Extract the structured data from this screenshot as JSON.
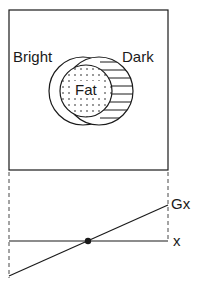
{
  "diagram": {
    "labels": {
      "bright": "Bright",
      "dark": "Dark",
      "fat": "Fat",
      "gx": "Gx",
      "x": "x"
    },
    "colors": {
      "stroke": "#1a1a1a",
      "background": "#ffffff"
    },
    "regions": [
      {
        "name": "bright",
        "description": "outer left crescent (unfilled)"
      },
      {
        "name": "fat",
        "description": "central dotted circle"
      },
      {
        "name": "dark",
        "description": "right crescent with horizontal hatching"
      }
    ],
    "graph": {
      "axis_label": "x",
      "line_label": "Gx",
      "intersection_marker": "filled dot at zero crossing"
    }
  }
}
